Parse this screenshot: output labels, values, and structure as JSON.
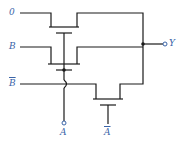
{
  "diagram": {
    "type": "pass-transistor logic circuit",
    "inputs": [
      {
        "id": "in0",
        "label": "0"
      },
      {
        "id": "inB",
        "label": "B"
      },
      {
        "id": "inBbar",
        "label": "B",
        "overline": true
      },
      {
        "id": "inA",
        "label": "A"
      },
      {
        "id": "inAbar",
        "label": "A",
        "overline": true
      }
    ],
    "output": {
      "id": "outY",
      "label": "Y"
    },
    "transistors": [
      {
        "name": "T1",
        "source": "0",
        "gate": "A",
        "drain": "Y"
      },
      {
        "name": "T2",
        "source": "B",
        "gate": "A",
        "drain": "Y"
      },
      {
        "name": "T3",
        "source": "B̄",
        "gate": "Ā",
        "drain": "Y"
      }
    ],
    "colors": {
      "wire": "#1a1a1a",
      "label": "#3a64a8"
    }
  }
}
